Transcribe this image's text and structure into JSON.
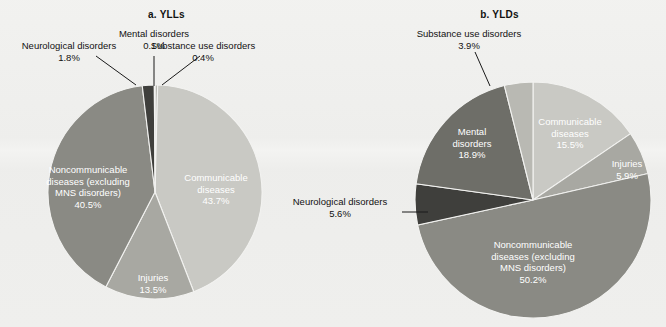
{
  "figure": {
    "background_color": "#efefed",
    "panels": [
      {
        "id": "a",
        "title": "a. YLLs"
      },
      {
        "id": "b",
        "title": "b. YLDs"
      }
    ]
  },
  "palette": {
    "communicable": "#c9c9c4",
    "injuries": "#a8a8a2",
    "noncommunicable": "#8a8a84",
    "neurological": "#3f3f3c",
    "mental": "#6e6e68",
    "substance_use": "#b9b9b3",
    "leader_line": "#1a1a1a",
    "slice_border": "#f2f2f0",
    "label_dark": "#111111",
    "label_light": "#ffffff"
  },
  "chart_data": [
    {
      "type": "pie",
      "id": "yll",
      "title": "a. YLLs",
      "legend": "none",
      "start_angle_deg": 0,
      "direction": "clockwise",
      "center": {
        "x": 155,
        "y": 192
      },
      "radius": 107,
      "categories": [
        "Substance use disorders",
        "Communicable diseases",
        "Injuries",
        "Noncommunicable diseases (excluding MNS disorders)",
        "Neurological disorders",
        "Mental disorders"
      ],
      "values": [
        0.4,
        43.7,
        13.5,
        40.5,
        1.8,
        0.1
      ],
      "slices": [
        {
          "key": "substance_use",
          "label": "Substance use disorders",
          "value": 0.4,
          "value_text": "0.4%",
          "color": "#b9b9b3",
          "label_placement": "outside"
        },
        {
          "key": "communicable",
          "label": "Communicable diseases",
          "value": 43.7,
          "value_text": "43.7%",
          "color": "#c9c9c4",
          "label_placement": "inside"
        },
        {
          "key": "injuries",
          "label": "Injuries",
          "value": 13.5,
          "value_text": "13.5%",
          "color": "#a8a8a2",
          "label_placement": "inside"
        },
        {
          "key": "noncommunicable",
          "label": "Noncommunicable diseases (excluding MNS disorders)",
          "value": 40.5,
          "value_text": "40.5%",
          "color": "#8a8a84",
          "label_placement": "inside"
        },
        {
          "key": "neurological",
          "label": "Neurological disorders",
          "value": 1.8,
          "value_text": "1.8%",
          "color": "#3f3f3c",
          "label_placement": "outside"
        },
        {
          "key": "mental",
          "label": "Mental disorders",
          "value": 0.1,
          "value_text": "0.1%",
          "color": "#6e6e68",
          "label_placement": "outside"
        }
      ]
    },
    {
      "type": "pie",
      "id": "yld",
      "title": "b. YLDs",
      "legend": "none",
      "start_angle_deg": 0,
      "direction": "clockwise",
      "center": {
        "x": 533,
        "y": 200
      },
      "radius": 118,
      "categories": [
        "Communicable diseases",
        "Injuries",
        "Noncommunicable diseases (excluding MNS disorders)",
        "Neurological disorders",
        "Mental disorders",
        "Substance use disorders"
      ],
      "values": [
        15.5,
        5.9,
        50.2,
        5.6,
        18.9,
        3.9
      ],
      "slices": [
        {
          "key": "communicable",
          "label": "Communicable diseases",
          "value": 15.5,
          "value_text": "15.5%",
          "color": "#c9c9c4",
          "label_placement": "inside"
        },
        {
          "key": "injuries",
          "label": "Injuries",
          "value": 5.9,
          "value_text": "5.9%",
          "color": "#a8a8a2",
          "label_placement": "inside"
        },
        {
          "key": "noncommunicable",
          "label": "Noncommunicable diseases (excluding MNS disorders)",
          "value": 50.2,
          "value_text": "50.2%",
          "color": "#8a8a84",
          "label_placement": "inside"
        },
        {
          "key": "neurological",
          "label": "Neurological disorders",
          "value": 5.6,
          "value_text": "5.6%",
          "color": "#3f3f3c",
          "label_placement": "outside"
        },
        {
          "key": "mental",
          "label": "Mental disorders",
          "value": 18.9,
          "value_text": "18.9%",
          "color": "#6e6e68",
          "label_placement": "inside"
        },
        {
          "key": "substance_use",
          "label": "Substance use disorders",
          "value": 3.9,
          "value_text": "3.9%",
          "color": "#b9b9b3",
          "label_placement": "outside"
        }
      ]
    }
  ],
  "labels_a": {
    "neurological": {
      "name": "Neurological disorders",
      "pct": "1.8%"
    },
    "mental": {
      "name": "Mental disorders",
      "pct": "0.1%"
    },
    "substance": {
      "name": "Substance use disorders",
      "pct": "0.4%"
    },
    "communicable_l1": "Communicable",
    "communicable_l2": "diseases",
    "communicable_pct": "43.7%",
    "injuries_l1": "Injuries",
    "injuries_pct": "13.5%",
    "ncd_l1": "Noncommunicable",
    "ncd_l2": "diseases (excluding",
    "ncd_l3": "MNS disorders)",
    "ncd_pct": "40.5%"
  },
  "labels_b": {
    "substance": {
      "name": "Substance use disorders",
      "pct": "3.9%"
    },
    "neurological": {
      "name": "Neurological disorders",
      "pct": "5.6%"
    },
    "communicable_l1": "Communicable",
    "communicable_l2": "diseases",
    "communicable_pct": "15.5%",
    "injuries_l1": "Injuries",
    "injuries_pct": "5.9%",
    "mental_l1": "Mental",
    "mental_l2": "disorders",
    "mental_pct": "18.9%",
    "ncd_l1": "Noncommunicable",
    "ncd_l2": "diseases (excluding",
    "ncd_l3": "MNS disorders)",
    "ncd_pct": "50.2%"
  }
}
